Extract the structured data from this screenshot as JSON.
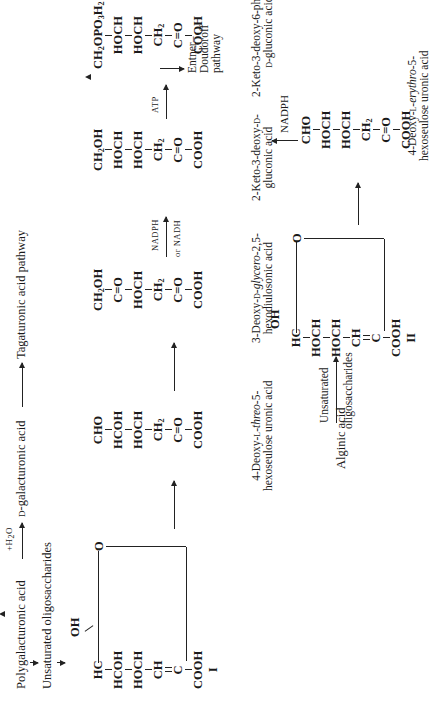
{
  "figure": {
    "orientation": "rotated 90 degrees counter-clockwise",
    "top_pathway": {
      "start": "Polygalacturonic acid",
      "hydrolysis_label": "+H2O",
      "product": "D-galacturonic acid",
      "destination": "Tagaturonic acid pathway",
      "branch": "Unsaturated oligosaccharides"
    },
    "compounds": [
      {
        "id": "I",
        "roman_label": "I",
        "type": "ring",
        "substituent_top": "OH",
        "groups": [
          "HC",
          "HCOH",
          "HOCH",
          "CH",
          "C",
          "COOH"
        ],
        "ring_oxygen": "O",
        "double_bond": "CH=C"
      },
      {
        "id": "threo",
        "name_line1": "4-Deoxy-L-",
        "name_italic": "threo",
        "name_line1_end": "-5-",
        "name_line2": "hexoseulose uronic acid",
        "groups": [
          "CHO",
          "HCOH",
          "HOCH",
          "CH2",
          "C=O",
          "COOH"
        ]
      },
      {
        "id": "diketo",
        "name_line1": "3-Deoxy-D-",
        "name_italic": "glycero",
        "name_line1_end": "-2,5-",
        "name_line2": "hexodiulosonic acid",
        "groups": [
          "CH2OH",
          "C=O",
          "HOCH",
          "CH2",
          "C=O",
          "COOH"
        ]
      },
      {
        "id": "kdg",
        "name_line1": "2-Keto-3-deoxy-D-",
        "name_line2": "gluconic acid",
        "groups": [
          "CH2OH",
          "HOCH",
          "HOCH",
          "CH2",
          "C=O",
          "COOH"
        ]
      },
      {
        "id": "kdpg",
        "name_line1": "2-Keto-3-deoxy-6-phospho-",
        "name_line2": "D-gluconic acid",
        "groups": [
          "CH2OPO3H2",
          "HOCH",
          "HOCH",
          "CH2",
          "C=O",
          "COOH"
        ]
      },
      {
        "id": "erythro",
        "name_line1": "4-Deoxy-L-",
        "name_italic": "erythro",
        "name_line1_end": "-5-",
        "name_line2": "hexoseulose uronic acid",
        "groups": [
          "CHO",
          "HOCH",
          "HOCH",
          "CH2",
          "C=O",
          "COOH"
        ]
      },
      {
        "id": "II",
        "roman_label": "II",
        "type": "ring",
        "substituent_top": "OH",
        "groups": [
          "HC",
          "HOCH",
          "HOCH",
          "CH",
          "C",
          "COOH"
        ],
        "ring_oxygen": "O",
        "double_bond": "CH=C"
      }
    ],
    "arrows": [
      {
        "from": "I",
        "to": "threo",
        "label": ""
      },
      {
        "from": "threo",
        "to": "diketo",
        "label": ""
      },
      {
        "from": "diketo",
        "to": "kdg",
        "label_top": "NADPH",
        "label_bottom": "or NADH"
      },
      {
        "from": "kdg",
        "to": "kdpg",
        "label_top": "ATP"
      },
      {
        "from": "kdpg",
        "to": "Entner-Doudoroff pathway"
      },
      {
        "from": "erythro",
        "to": "kdg",
        "label": "NADPH"
      },
      {
        "from": "II",
        "to": "erythro",
        "label": ""
      },
      {
        "from": "Alginic acid",
        "to": "II",
        "label_top": "Unsaturated",
        "label_bottom": "oligosaccharides"
      }
    ],
    "bottom_pathway": {
      "start": "Alginic acid",
      "arrow_label_top": "Unsaturated",
      "arrow_label_bottom": "oligosaccharides"
    },
    "entner": {
      "line1": "Entner–",
      "line2": "Doudoroff",
      "line3": "pathway"
    },
    "cofactors": {
      "nadph_or_nadh_top": "NADPH",
      "nadph_or_nadh_bottom": "or NADH",
      "atp": "ATP",
      "nadph": "NADPH"
    }
  }
}
